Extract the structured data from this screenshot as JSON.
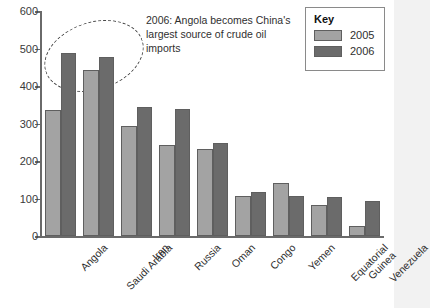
{
  "chart_data": {
    "type": "bar",
    "title": "",
    "xlabel": "",
    "ylabel": "Thousand barrels per day",
    "ylim": [
      0,
      600
    ],
    "ytick_step": 100,
    "yticks": [
      "600",
      "500",
      "400",
      "300",
      "200",
      "100",
      "0"
    ],
    "grid": false,
    "legend_position": "top-right",
    "legend_title": "Key",
    "categories": [
      "Angola",
      "Saudi Arabia",
      "Iran",
      "Russia",
      "Oman",
      "Congo",
      "Yemen",
      "Equatorial\nGuinea",
      "Venezuela"
    ],
    "series": [
      {
        "name": "2005",
        "color": "#a3a3a3",
        "values": [
          336,
          443,
          293,
          243,
          232,
          107,
          142,
          82,
          27
        ]
      },
      {
        "name": "2006",
        "color": "#6b6b6b",
        "values": [
          487,
          477,
          344,
          339,
          248,
          117,
          108,
          104,
          93
        ]
      }
    ],
    "annotations": [
      {
        "name": "angola-callout",
        "text": "2006: Angola becomes China's largest source of crude oil imports",
        "shape": "dashed-ellipse"
      }
    ]
  },
  "legend": {
    "title": "Key",
    "entries": [
      {
        "label": "2005",
        "color": "#a3a3a3"
      },
      {
        "label": "2006",
        "color": "#6b6b6b"
      }
    ]
  },
  "axes": {
    "y_title": "Thousand barrels per day"
  }
}
